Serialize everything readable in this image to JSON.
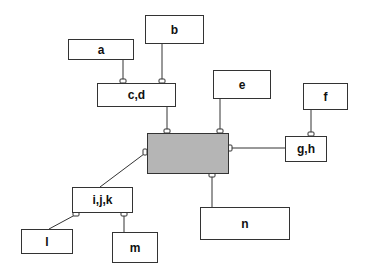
{
  "diagram": {
    "type": "entity-relationship",
    "nodes": [
      {
        "id": "a",
        "label": "a"
      },
      {
        "id": "b",
        "label": "b"
      },
      {
        "id": "cd",
        "label": "c,d"
      },
      {
        "id": "e",
        "label": "e"
      },
      {
        "id": "f",
        "label": "f"
      },
      {
        "id": "gh",
        "label": "g,h"
      },
      {
        "id": "center",
        "label": ""
      },
      {
        "id": "ijk",
        "label": "i,j,k"
      },
      {
        "id": "l",
        "label": "l"
      },
      {
        "id": "m",
        "label": "m"
      },
      {
        "id": "n",
        "label": "n"
      }
    ],
    "edges": [
      {
        "from": "a",
        "to": "cd"
      },
      {
        "from": "b",
        "to": "cd"
      },
      {
        "from": "cd",
        "to": "center"
      },
      {
        "from": "e",
        "to": "center"
      },
      {
        "from": "f",
        "to": "gh"
      },
      {
        "from": "gh",
        "to": "center"
      },
      {
        "from": "ijk",
        "to": "center"
      },
      {
        "from": "n",
        "to": "center"
      },
      {
        "from": "l",
        "to": "ijk"
      },
      {
        "from": "m",
        "to": "ijk"
      }
    ],
    "colors": {
      "center_fill": "#b5b5b5",
      "line": "#333333",
      "box_fill": "#ffffff"
    }
  }
}
